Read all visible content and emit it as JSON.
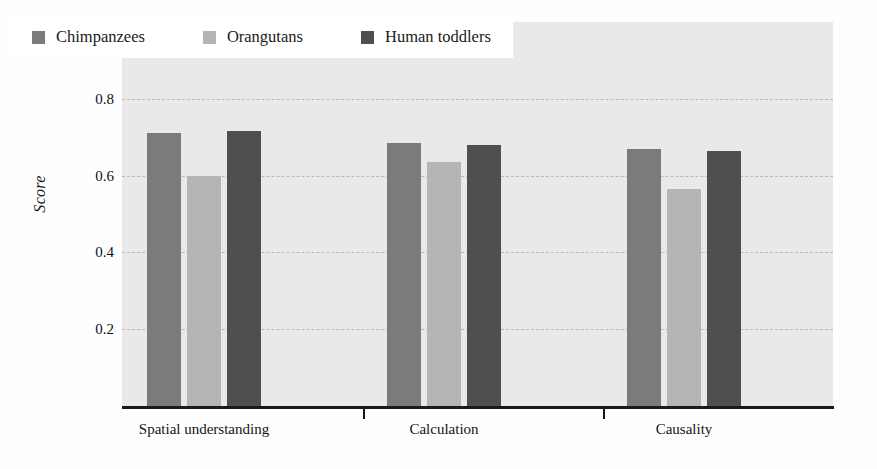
{
  "chart_data": {
    "type": "bar",
    "title": "",
    "xlabel": "",
    "ylabel": "Score",
    "ylim": [
      0,
      1
    ],
    "grid": true,
    "gridlines": [
      0.2,
      0.4,
      0.6,
      0.8
    ],
    "ytick_labels": [
      "1",
      "0.8",
      "0.6",
      "0.4",
      "0.2"
    ],
    "ytick_values": [
      1,
      0.8,
      0.6,
      0.4,
      0.2
    ],
    "legend_position": "top-left",
    "categories": [
      "Spatial understanding",
      "Calculation",
      "Causality"
    ],
    "series": [
      {
        "name": "Chimpanzees",
        "color": "#7b7b7b",
        "values": [
          0.71,
          0.685,
          0.67
        ]
      },
      {
        "name": "Orangutans",
        "color": "#b5b5b5",
        "values": [
          0.6,
          0.635,
          0.565
        ]
      },
      {
        "name": "Human toddlers",
        "color": "#4f4f4f",
        "values": [
          0.715,
          0.68,
          0.665
        ]
      }
    ]
  },
  "legend": {
    "items": [
      {
        "label": "Chimpanzees",
        "swatch": "#7b7b7b"
      },
      {
        "label": "Orangutans",
        "swatch": "#b5b5b5"
      },
      {
        "label": "Human toddlers",
        "swatch": "#4f4f4f"
      }
    ]
  },
  "axes": {
    "y_title": "Score"
  },
  "colors": {
    "plot_background": "#e9e9e9",
    "gridline": "#b9b9c4",
    "axis": "#1a1a1a",
    "legend_background": "#ffffff",
    "page_background": "#fefefe"
  }
}
